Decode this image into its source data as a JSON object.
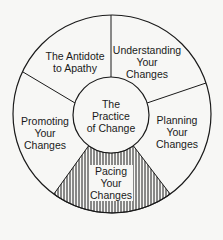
{
  "diagram": {
    "center": {
      "label_lines": [
        "The",
        "Practice",
        "of Change"
      ]
    },
    "segments": [
      {
        "id": "understanding",
        "label_lines": [
          "Understanding",
          "Your",
          "Changes"
        ],
        "hatched": false
      },
      {
        "id": "planning",
        "label_lines": [
          "Planning",
          "Your",
          "Changes"
        ],
        "hatched": false
      },
      {
        "id": "pacing",
        "label_lines": [
          "Pacing",
          "Your",
          "Changes"
        ],
        "hatched": true
      },
      {
        "id": "promoting",
        "label_lines": [
          "Promoting",
          "Your",
          "Changes"
        ],
        "hatched": false
      },
      {
        "id": "antidote",
        "label_lines": [
          "The Antidote",
          "to Apathy"
        ],
        "hatched": false
      }
    ],
    "colors": {
      "line": "#1a1a1a",
      "background": "#f7f7f5"
    }
  }
}
